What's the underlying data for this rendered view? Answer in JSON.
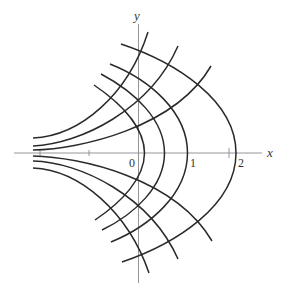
{
  "figure": {
    "axes": {
      "x_label": "x",
      "y_label": "y",
      "tick_labels": [
        "0",
        "1",
        "2"
      ],
      "ticks_x": [
        -2,
        -1,
        0,
        1,
        2
      ]
    },
    "colors": {
      "curve": "#2a2a2a",
      "axis": "#8a8a8a",
      "background": "#ffffff"
    },
    "families": {
      "right_opening_vertices_x": [
        0.12,
        0.52,
        1.0,
        2.0
      ],
      "left_opening_count": 6
    }
  }
}
